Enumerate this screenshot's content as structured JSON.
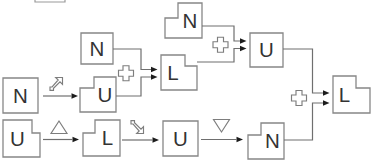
{
  "canvas": {
    "width": 374,
    "height": 166,
    "background": "#ffffff"
  },
  "colors": {
    "line": "#6f6f6f",
    "box_border": "#878787",
    "letter": "#333333",
    "arrowhead": "#1c1c1c",
    "symbol": "#7d7d7d",
    "clipped_edge": "#9a9a9a"
  },
  "boxes": [
    {
      "id": "box-top-n",
      "letter": "N",
      "x": 165,
      "y": 3,
      "w": 37,
      "h": 35,
      "shape": "notch-tl",
      "nw": 13,
      "nh": 15
    },
    {
      "id": "box-topright-u",
      "letter": "U",
      "x": 250,
      "y": 33,
      "w": 33,
      "h": 34,
      "shape": "square",
      "nw": 0,
      "nh": 0
    },
    {
      "id": "box-mid-n",
      "letter": "N",
      "x": 81,
      "y": 33,
      "w": 32,
      "h": 31,
      "shape": "square",
      "nw": 0,
      "nh": 0
    },
    {
      "id": "box-mid-l",
      "letter": "L",
      "x": 161,
      "y": 55,
      "w": 36,
      "h": 35,
      "shape": "notch-tr",
      "nw": 12,
      "nh": 11
    },
    {
      "id": "box-left-n",
      "letter": "N",
      "x": 3,
      "y": 78,
      "w": 35,
      "h": 35,
      "shape": "square",
      "nw": 0,
      "nh": 0
    },
    {
      "id": "box-mid-u",
      "letter": "U",
      "x": 80,
      "y": 77,
      "w": 36,
      "h": 35,
      "shape": "notch-tl",
      "nw": 14,
      "nh": 11
    },
    {
      "id": "box-bottomleft-u",
      "letter": "U",
      "x": 3,
      "y": 120,
      "w": 37,
      "h": 37,
      "shape": "notch-tr",
      "nw": 8,
      "nh": 13
    },
    {
      "id": "box-bottom-l",
      "letter": "L",
      "x": 83,
      "y": 120,
      "w": 37,
      "h": 36,
      "shape": "notch-tl",
      "nw": 12,
      "nh": 13
    },
    {
      "id": "box-bottom-u",
      "letter": "U",
      "x": 163,
      "y": 121,
      "w": 35,
      "h": 35,
      "shape": "square",
      "nw": 0,
      "nh": 0
    },
    {
      "id": "box-bottomright-n",
      "letter": "N",
      "x": 248,
      "y": 123,
      "w": 36,
      "h": 36,
      "shape": "notch-tl",
      "nw": 13,
      "nh": 12
    },
    {
      "id": "box-right-l",
      "letter": "L",
      "x": 333,
      "y": 76,
      "w": 37,
      "h": 37,
      "shape": "notch-tr",
      "nw": 14,
      "nh": 12
    }
  ],
  "connectors": [
    {
      "id": "clipped-box-bottom-edge",
      "arrow": false,
      "clipped": true,
      "points": [
        [
          35,
          0
        ],
        [
          35,
          2
        ],
        [
          65,
          2
        ],
        [
          65,
          0
        ]
      ]
    },
    {
      "id": "arrow-leftn-to-midu",
      "arrow": true,
      "points": [
        [
          43,
          96
        ],
        [
          78,
          96
        ]
      ]
    },
    {
      "id": "arrow-blu-to-bottoml",
      "arrow": true,
      "points": [
        [
          43,
          139.5
        ],
        [
          79,
          139.5
        ]
      ]
    },
    {
      "id": "arrow-bottoml-to-bottomu",
      "arrow": true,
      "points": [
        [
          122,
          140
        ],
        [
          159,
          140
        ]
      ]
    },
    {
      "id": "arrow-bottomu-to-brn",
      "arrow": true,
      "points": [
        [
          201,
          139.5
        ],
        [
          243,
          139.5
        ]
      ]
    },
    {
      "id": "join-mid-from-n",
      "arrow": true,
      "points": [
        [
          113,
          49
        ],
        [
          141,
          49
        ],
        [
          141,
          69.5
        ],
        [
          157.5,
          69.5
        ]
      ]
    },
    {
      "id": "join-mid-from-u",
      "arrow": true,
      "points": [
        [
          116,
          96
        ],
        [
          141,
          96
        ],
        [
          141,
          77
        ],
        [
          157.5,
          77
        ]
      ]
    },
    {
      "id": "join-top-from-n",
      "arrow": true,
      "points": [
        [
          202,
          26
        ],
        [
          234,
          26
        ],
        [
          234,
          41
        ],
        [
          246.5,
          41
        ]
      ]
    },
    {
      "id": "join-top-from-l",
      "arrow": true,
      "points": [
        [
          197,
          62
        ],
        [
          234,
          62
        ],
        [
          234,
          48.5
        ],
        [
          246.5,
          48.5
        ]
      ]
    },
    {
      "id": "join-right-from-u",
      "arrow": true,
      "points": [
        [
          283,
          49
        ],
        [
          312.5,
          49
        ],
        [
          312.5,
          93
        ],
        [
          329.5,
          93
        ]
      ]
    },
    {
      "id": "join-right-from-n",
      "arrow": true,
      "points": [
        [
          284,
          140
        ],
        [
          312.5,
          140
        ],
        [
          312.5,
          103
        ],
        [
          329.5,
          103
        ]
      ]
    }
  ],
  "symbols": [
    {
      "id": "merge-plus-icon-top",
      "type": "plus-outline",
      "cx": 220.5,
      "cy": 44.7
    },
    {
      "id": "merge-plus-icon-mid",
      "type": "plus-outline",
      "cx": 126,
      "cy": 73.2
    },
    {
      "id": "merge-plus-icon-right",
      "type": "plus-outline",
      "cx": 299,
      "cy": 98
    },
    {
      "id": "diagonal-arrow-ne-icon",
      "type": "diag-arrow-ne",
      "cx": 56,
      "cy": 85
    },
    {
      "id": "triangle-up-icon",
      "type": "triangle-up",
      "cx": 59,
      "cy": 127.5
    },
    {
      "id": "diagonal-arrow-se-icon",
      "type": "diag-arrow-se",
      "cx": 137,
      "cy": 126
    },
    {
      "id": "triangle-down-icon",
      "type": "triangle-down",
      "cx": 221.5,
      "cy": 125.5
    }
  ]
}
